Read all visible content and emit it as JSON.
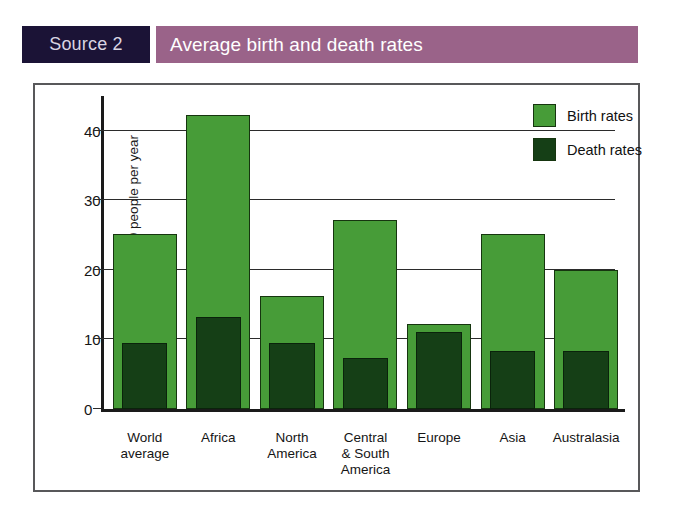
{
  "header": {
    "source_label": "Source 2",
    "title": "Average birth and death rates",
    "source_bg": "#1b1336",
    "title_bg": "#9a6389",
    "title_color": "#ffffff"
  },
  "chart_data": {
    "type": "bar",
    "title": "Average birth and death rates",
    "xlabel": "",
    "ylabel": "per 1000 people per year",
    "ylim": [
      0,
      45
    ],
    "yticks": [
      0,
      10,
      20,
      30,
      40
    ],
    "grid": true,
    "legend_position": "top-right",
    "categories": [
      "World average",
      "Africa",
      "North America",
      "Central & South America",
      "Europe",
      "Asia",
      "Australasia"
    ],
    "category_lines": [
      [
        "World",
        "average"
      ],
      [
        "Africa"
      ],
      [
        "North",
        "America"
      ],
      [
        "Central",
        "& South",
        "America"
      ],
      [
        "Europe"
      ],
      [
        "Asia"
      ],
      [
        "Australasia"
      ]
    ],
    "series": [
      {
        "name": "Birth rates",
        "color": "#479c38",
        "values": [
          25.2,
          42.2,
          16.2,
          27.2,
          12.2,
          25.2,
          20.0
        ]
      },
      {
        "name": "Death rates",
        "color": "#153f16",
        "values": [
          9.5,
          13.3,
          9.5,
          7.4,
          11.1,
          8.4,
          8.4
        ]
      }
    ]
  },
  "legend": {
    "items": [
      {
        "label": "Birth rates",
        "color": "#479c38"
      },
      {
        "label": "Death rates",
        "color": "#153f16"
      }
    ]
  }
}
